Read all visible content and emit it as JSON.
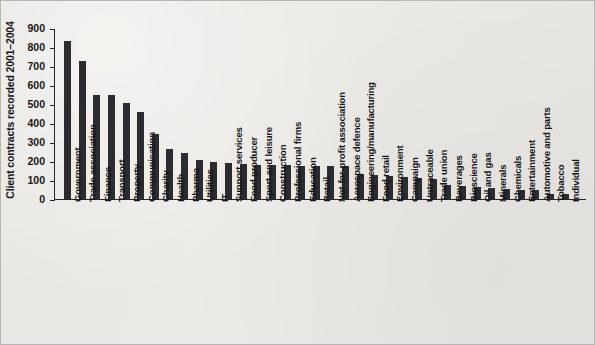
{
  "chart_data": {
    "type": "bar",
    "title": "",
    "subtitle": "",
    "xlabel": "",
    "ylabel": "Client contracts recorded 2001–2004",
    "ylim": [
      0,
      900
    ],
    "ytick_values": [
      0,
      100,
      200,
      300,
      400,
      500,
      600,
      700,
      800,
      900
    ],
    "ytick_labels": [
      "0",
      "100",
      "200",
      "300",
      "400",
      "500",
      "600",
      "700",
      "800",
      "900"
    ],
    "grid": false,
    "legend": null,
    "legend_position": "none",
    "bar_color": "#2c2c30",
    "background_color": "#eceae6",
    "categories": [
      "Government",
      "Trade association",
      "Finance",
      "Transport",
      "Property",
      "Communication",
      "Charity",
      "Health",
      "Pharma",
      "Utilities",
      "IT",
      "Support services",
      "Food producer",
      "Sport and leisure",
      "Construction",
      "Professional firms",
      "Education",
      "Retail",
      "Not-for-profit association",
      "Aerospace defence",
      "Engineering/manufacturing",
      "Food retail",
      "Environment",
      "Campaign",
      "Untraceable",
      "Trade union",
      "Beverages",
      "Bioscience",
      "Oil and gas",
      "Minerals",
      "Chemicals",
      "Entertainment",
      "Automotive and parts",
      "Tobacco",
      "Individual"
    ],
    "values": [
      830,
      725,
      550,
      550,
      505,
      460,
      340,
      265,
      240,
      205,
      195,
      190,
      185,
      180,
      180,
      178,
      175,
      175,
      175,
      175,
      130,
      125,
      120,
      115,
      110,
      105,
      75,
      70,
      65,
      60,
      55,
      50,
      48,
      28,
      25
    ]
  }
}
